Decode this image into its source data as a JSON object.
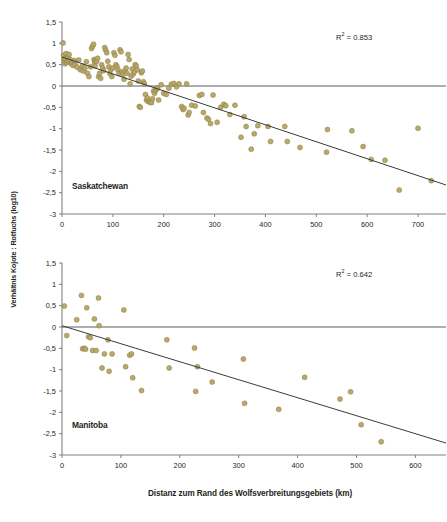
{
  "figure": {
    "ylabel": "Verhältnis Kojote : Rotfuchs (log10)",
    "xlabel": "Distanz zum Rand des Wolfsverbreitungsgebiets (km)",
    "marker_color": "#b5a463",
    "marker_stroke": "#8d7d44",
    "line_color": "#3c3c3c",
    "axis_color": "#808080",
    "background": "#ffffff"
  },
  "chart_data": [
    {
      "type": "scatter",
      "title": "Saskatchewan",
      "panel_label": "Saskatchewan",
      "r2_label": "R² = 0.853",
      "r2_prefix": "R",
      "r2_sup": "2",
      "r2_value": "= 0.853",
      "xlabel": "Distanz zum Rand des Wolfsverbreitungsgebiets (km)",
      "ylabel": "Verhältnis Kojote : Rotfuchs (log10)",
      "xlim": [
        0,
        755
      ],
      "ylim": [
        -3,
        1.5
      ],
      "xticks": [
        0,
        100,
        200,
        300,
        400,
        500,
        600,
        700
      ],
      "xticklabels": [
        "0",
        "100",
        "200",
        "300",
        "400",
        "500",
        "600",
        "700"
      ],
      "yticks": [
        1.5,
        1,
        0.5,
        0,
        -0.5,
        -1,
        -1.5,
        -2,
        -2.5,
        -3
      ],
      "yticklabels": [
        "1,5",
        "1",
        "0,5",
        "0",
        "-0,5",
        "-1",
        "-1,5",
        "-2",
        "-2,5",
        "-3"
      ],
      "grid": false,
      "zero_line": true,
      "trendline": {
        "x0": 0,
        "y0": 0.68,
        "x1": 755,
        "y1": -2.32
      },
      "points": [
        [
          2,
          1.01
        ],
        [
          3,
          0.72
        ],
        [
          4,
          0.62
        ],
        [
          5,
          0.57
        ],
        [
          6,
          0.52
        ],
        [
          7,
          0.64
        ],
        [
          8,
          0.76
        ],
        [
          9,
          0.55
        ],
        [
          10,
          0.6
        ],
        [
          12,
          0.67
        ],
        [
          13,
          0.58
        ],
        [
          14,
          0.74
        ],
        [
          16,
          0.62
        ],
        [
          18,
          0.52
        ],
        [
          20,
          0.55
        ],
        [
          22,
          0.48
        ],
        [
          24,
          0.6
        ],
        [
          26,
          0.5
        ],
        [
          30,
          0.44
        ],
        [
          33,
          0.61
        ],
        [
          36,
          0.38
        ],
        [
          40,
          0.47
        ],
        [
          42,
          0.35
        ],
        [
          45,
          0.42
        ],
        [
          48,
          0.57
        ],
        [
          50,
          0.3
        ],
        [
          53,
          0.22
        ],
        [
          56,
          0.45
        ],
        [
          58,
          0.88
        ],
        [
          60,
          0.93
        ],
        [
          62,
          0.98
        ],
        [
          63,
          0.62
        ],
        [
          64,
          0.55
        ],
        [
          65,
          0.47
        ],
        [
          66,
          0.6
        ],
        [
          68,
          0.58
        ],
        [
          70,
          0.65
        ],
        [
          72,
          0.22
        ],
        [
          74,
          0.3
        ],
        [
          76,
          0.18
        ],
        [
          78,
          0.5
        ],
        [
          80,
          0.42
        ],
        [
          82,
          0.36
        ],
        [
          84,
          0.9
        ],
        [
          86,
          0.84
        ],
        [
          88,
          0.78
        ],
        [
          90,
          0.58
        ],
        [
          92,
          0.45
        ],
        [
          94,
          0.3
        ],
        [
          96,
          0.38
        ],
        [
          98,
          0.22
        ],
        [
          100,
          0.42
        ],
        [
          102,
          0.78
        ],
        [
          104,
          0.72
        ],
        [
          106,
          0.5
        ],
        [
          108,
          0.46
        ],
        [
          110,
          0.38
        ],
        [
          112,
          0.3
        ],
        [
          114,
          0.85
        ],
        [
          116,
          0.8
        ],
        [
          118,
          0.33
        ],
        [
          120,
          0.28
        ],
        [
          122,
          0.16
        ],
        [
          124,
          0.35
        ],
        [
          126,
          0.42
        ],
        [
          128,
          0.3
        ],
        [
          130,
          0.74
        ],
        [
          132,
          0.62
        ],
        [
          134,
          0.05
        ],
        [
          136,
          0.23
        ],
        [
          138,
          0.4
        ],
        [
          140,
          0.28
        ],
        [
          142,
          0.33
        ],
        [
          144,
          0.5
        ],
        [
          146,
          0.47
        ],
        [
          148,
          0.38
        ],
        [
          150,
          0.12
        ],
        [
          152,
          -0.48
        ],
        [
          154,
          -0.5
        ],
        [
          156,
          0.31
        ],
        [
          158,
          0.35
        ],
        [
          160,
          0.1
        ],
        [
          162,
          0.05
        ],
        [
          164,
          -0.2
        ],
        [
          166,
          -0.33
        ],
        [
          168,
          -0.28
        ],
        [
          170,
          -0.37
        ],
        [
          172,
          -0.36
        ],
        [
          174,
          -0.38
        ],
        [
          176,
          -0.39
        ],
        [
          178,
          -0.3
        ],
        [
          180,
          -0.12
        ],
        [
          182,
          -0.17
        ],
        [
          184,
          -0.1
        ],
        [
          186,
          -0.07
        ],
        [
          188,
          -0.05
        ],
        [
          190,
          -0.33
        ],
        [
          195,
          0.03
        ],
        [
          200,
          -0.17
        ],
        [
          205,
          -0.2
        ],
        [
          210,
          -0.05
        ],
        [
          215,
          0.04
        ],
        [
          220,
          0.06
        ],
        [
          225,
          -0.02
        ],
        [
          230,
          0.05
        ],
        [
          235,
          -0.48
        ],
        [
          238,
          -0.55
        ],
        [
          240,
          -0.52
        ],
        [
          245,
          0.05
        ],
        [
          248,
          -0.68
        ],
        [
          250,
          -0.62
        ],
        [
          255,
          -0.45
        ],
        [
          262,
          -0.47
        ],
        [
          270,
          -0.22
        ],
        [
          275,
          -0.2
        ],
        [
          278,
          -0.62
        ],
        [
          285,
          -0.75
        ],
        [
          288,
          -0.78
        ],
        [
          292,
          -0.88
        ],
        [
          297,
          -0.21
        ],
        [
          305,
          -0.85
        ],
        [
          312,
          -0.5
        ],
        [
          318,
          -0.43
        ],
        [
          322,
          -0.46
        ],
        [
          330,
          -0.67
        ],
        [
          340,
          -0.45
        ],
        [
          352,
          -1.2
        ],
        [
          358,
          -0.72
        ],
        [
          362,
          -0.95
        ],
        [
          372,
          -1.48
        ],
        [
          378,
          -1.12
        ],
        [
          385,
          -0.93
        ],
        [
          405,
          -0.95
        ],
        [
          410,
          -1.3
        ],
        [
          438,
          -0.95
        ],
        [
          443,
          -1.3
        ],
        [
          468,
          -1.44
        ],
        [
          520,
          -1.55
        ],
        [
          522,
          -1.02
        ],
        [
          570,
          -1.05
        ],
        [
          592,
          -1.42
        ],
        [
          608,
          -1.72
        ],
        [
          635,
          -1.74
        ],
        [
          663,
          -2.44
        ],
        [
          700,
          -0.99
        ],
        [
          726,
          -2.22
        ]
      ]
    },
    {
      "type": "scatter",
      "title": "Manitoba",
      "panel_label": "Manitoba",
      "r2_label": "R² = 0.642",
      "r2_prefix": "R",
      "r2_sup": "2",
      "r2_value": "= 0.642",
      "xlabel": "Distanz zum Rand des Wolfsverbreitungsgebiets (km)",
      "ylabel": "Verhältnis Kojote : Rotfuchs (log10)",
      "xlim": [
        0,
        652
      ],
      "ylim": [
        -3,
        1.5
      ],
      "xticks": [
        0,
        100,
        200,
        300,
        400,
        500,
        600
      ],
      "xticklabels": [
        "0",
        "100",
        "200",
        "300",
        "400",
        "500",
        "600"
      ],
      "yticks": [
        1.5,
        1,
        0.5,
        0,
        -0.5,
        -1,
        -1.5,
        -2,
        -2.5,
        -3
      ],
      "yticklabels": [
        "1,5",
        "1",
        "0,5",
        "0",
        "-0,5",
        "-1",
        "-1,5",
        "-2",
        "-2,5",
        "-3"
      ],
      "grid": false,
      "zero_line": true,
      "trendline": {
        "x0": 0,
        "y0": 0.03,
        "x1": 652,
        "y1": -2.72
      },
      "points": [
        [
          4,
          0.49
        ],
        [
          8,
          -0.2
        ],
        [
          25,
          0.17
        ],
        [
          33,
          0.74
        ],
        [
          35,
          -0.51
        ],
        [
          38,
          -0.5
        ],
        [
          40,
          -0.52
        ],
        [
          42,
          0.45
        ],
        [
          45,
          -0.23
        ],
        [
          48,
          -0.25
        ],
        [
          52,
          -0.55
        ],
        [
          55,
          0.19
        ],
        [
          58,
          -0.55
        ],
        [
          62,
          0.68
        ],
        [
          63,
          0.03
        ],
        [
          68,
          -0.96
        ],
        [
          72,
          -0.63
        ],
        [
          78,
          -0.3
        ],
        [
          80,
          -1.04
        ],
        [
          85,
          -0.63
        ],
        [
          105,
          0.4
        ],
        [
          108,
          -0.93
        ],
        [
          115,
          -0.66
        ],
        [
          118,
          -0.63
        ],
        [
          120,
          -1.19
        ],
        [
          135,
          -1.49
        ],
        [
          178,
          -0.3
        ],
        [
          182,
          -0.96
        ],
        [
          225,
          -0.49
        ],
        [
          227,
          -1.51
        ],
        [
          230,
          -0.93
        ],
        [
          255,
          -1.29
        ],
        [
          308,
          -0.75
        ],
        [
          310,
          -1.79
        ],
        [
          368,
          -1.93
        ],
        [
          412,
          -1.18
        ],
        [
          472,
          -1.69
        ],
        [
          490,
          -1.52
        ],
        [
          508,
          -2.29
        ],
        [
          542,
          -2.69
        ]
      ]
    }
  ]
}
